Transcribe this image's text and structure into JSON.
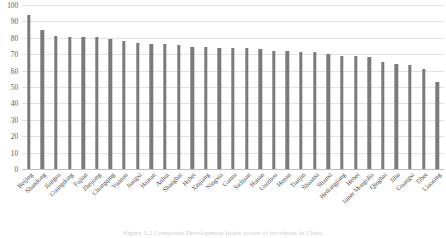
{
  "figure": {
    "caption": "Figure 3.2  Composite Development Index scores of provinces in China"
  },
  "chart_data": {
    "type": "bar",
    "title": "",
    "subtitle": "",
    "xlabel": "",
    "ylabel": "",
    "ylim": [
      0,
      100
    ],
    "yticks": [
      0,
      10,
      20,
      30,
      40,
      50,
      60,
      70,
      80,
      90,
      100
    ],
    "ytick_labels": [
      "0",
      "10",
      "20",
      "30",
      "40",
      "50",
      "60",
      "70",
      "80",
      "90",
      "100"
    ],
    "grid": "horizontal",
    "legend": "none",
    "bar_color": "#7b7b7b",
    "categories": [
      "Beijing",
      "Shandong",
      "Jiangsu",
      "Guangdong",
      "Fujian",
      "Zhejiang",
      "Chongqing",
      "Yunnan",
      "Jiangxi",
      "Hainan",
      "Anhui",
      "Shanghai",
      "Hubei",
      "Xinjiang",
      "Ningxia",
      "Gansu",
      "Sichuan",
      "Hunan",
      "Guizhou",
      "Henan",
      "Tianjin",
      "Shaanxi",
      "Shanxi",
      "Heilongjiang",
      "Hebei",
      "Inner Mongolia",
      "Qinghai",
      "Jilin",
      "Guangxi",
      "Tibet",
      "Liaoning"
    ],
    "values": [
      94,
      85,
      81,
      80.5,
      80.5,
      80.5,
      79,
      78,
      77,
      76.5,
      76,
      75.5,
      74.5,
      74.5,
      74,
      74,
      73.5,
      73,
      72,
      72,
      71.5,
      71.5,
      70,
      69,
      69,
      68,
      65,
      64,
      63.5,
      61,
      53
    ]
  }
}
